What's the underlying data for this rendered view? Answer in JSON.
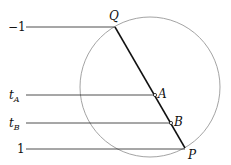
{
  "diagram": {
    "circle": {
      "cx": 150,
      "cy": 87,
      "r": 70,
      "stroke": "#999999"
    },
    "chord": {
      "from": "Q",
      "to": "P",
      "stroke": "#111111"
    },
    "points": {
      "Q": {
        "label": "Q",
        "x": 115,
        "y": 27
      },
      "A": {
        "label": "A",
        "x": 155,
        "y": 95
      },
      "B": {
        "label": "B",
        "x": 171,
        "y": 123
      },
      "P": {
        "label": "P",
        "x": 185,
        "y": 148
      }
    },
    "levels": [
      {
        "label": "−1",
        "y": 27,
        "x_end": 115
      },
      {
        "label_main": "t",
        "label_sub": "A",
        "y": 95,
        "x_end": 155
      },
      {
        "label_main": "t",
        "label_sub": "B",
        "y": 123,
        "x_end": 171
      },
      {
        "label": "1",
        "y": 149,
        "x_end": 185
      }
    ]
  }
}
